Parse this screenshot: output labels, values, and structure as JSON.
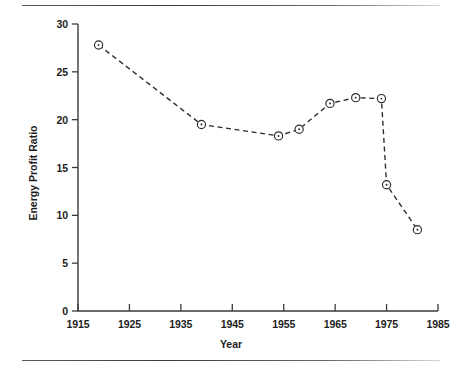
{
  "figure": {
    "divider_top_name": "top-divider",
    "divider_bottom_name": "bottom-divider"
  },
  "chart_data": {
    "type": "line",
    "title": "",
    "subtitle": "",
    "xlabel": "Year",
    "ylabel": "Energy Profit Ratio",
    "xlim": [
      1915,
      1985
    ],
    "ylim": [
      0,
      30
    ],
    "xticks": [
      1915,
      1925,
      1935,
      1945,
      1955,
      1965,
      1975,
      1985
    ],
    "xtick_labels": [
      "1915",
      "1925",
      "1935",
      "1945",
      "1955",
      "1965",
      "1975",
      "1985"
    ],
    "yticks": [
      0,
      5,
      10,
      15,
      20,
      25,
      30
    ],
    "ytick_labels": [
      "0",
      "5",
      "10",
      "15",
      "20",
      "25",
      "30"
    ],
    "grid": false,
    "legend": null,
    "line_style": "dashed",
    "marker": "circle-with-center-dot",
    "series": [
      {
        "name": "Energy Profit Ratio",
        "color": "#2b2b2b",
        "x": [
          1919,
          1939,
          1954,
          1958,
          1964,
          1969,
          1974,
          1975,
          1981
        ],
        "values": [
          27.8,
          19.5,
          18.3,
          19.0,
          21.7,
          22.3,
          22.2,
          13.2,
          8.5
        ],
        "points": [
          {
            "x": 1919,
            "y": 27.8
          },
          {
            "x": 1939,
            "y": 19.5
          },
          {
            "x": 1954,
            "y": 18.3
          },
          {
            "x": 1958,
            "y": 19.0
          },
          {
            "x": 1964,
            "y": 21.7
          },
          {
            "x": 1969,
            "y": 22.3
          },
          {
            "x": 1974,
            "y": 22.2
          },
          {
            "x": 1975,
            "y": 13.2
          },
          {
            "x": 1981,
            "y": 8.5
          }
        ]
      }
    ]
  }
}
